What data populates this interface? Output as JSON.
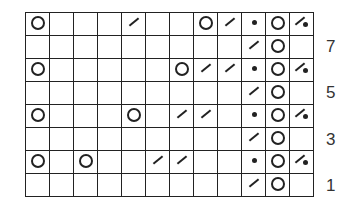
{
  "chart": {
    "type": "knitting-chart",
    "columns": 12,
    "rows": [
      {
        "row": 8,
        "cells": [
          "yo",
          "",
          "",
          "",
          "k2tog",
          "",
          "",
          "yo",
          "k2tog",
          "dot",
          "yo",
          "k2tog-dot"
        ]
      },
      {
        "row": 7,
        "cells": [
          "",
          "",
          "",
          "",
          "",
          "",
          "",
          "",
          "",
          "k2tog",
          "yo",
          ""
        ]
      },
      {
        "row": 6,
        "cells": [
          "yo",
          "",
          "",
          "",
          "",
          "",
          "yo",
          "k2tog",
          "k2tog",
          "dot",
          "yo",
          "k2tog-dot"
        ]
      },
      {
        "row": 5,
        "cells": [
          "",
          "",
          "",
          "",
          "",
          "",
          "",
          "",
          "",
          "k2tog",
          "yo",
          ""
        ]
      },
      {
        "row": 4,
        "cells": [
          "yo",
          "",
          "",
          "",
          "yo",
          "",
          "k2tog",
          "k2tog",
          "",
          "dot",
          "yo",
          "k2tog-dot"
        ]
      },
      {
        "row": 3,
        "cells": [
          "",
          "",
          "",
          "",
          "",
          "",
          "",
          "",
          "",
          "k2tog",
          "yo",
          ""
        ]
      },
      {
        "row": 2,
        "cells": [
          "yo",
          "",
          "yo",
          "",
          "",
          "k2tog",
          "k2tog",
          "",
          "",
          "dot",
          "yo",
          "k2tog-dot"
        ]
      },
      {
        "row": 1,
        "cells": [
          "",
          "",
          "",
          "",
          "",
          "",
          "",
          "",
          "",
          "k2tog",
          "yo",
          ""
        ]
      }
    ],
    "row_labels": [
      {
        "label": "7",
        "row_index": 1
      },
      {
        "label": "5",
        "row_index": 3
      },
      {
        "label": "3",
        "row_index": 5
      },
      {
        "label": "1",
        "row_index": 7
      }
    ]
  },
  "symbols": {
    "yo": "yarn-over-icon",
    "k2tog": "slash-decrease-icon",
    "dot": "dot-icon",
    "k2tog-dot": "slash-dot-icon"
  }
}
